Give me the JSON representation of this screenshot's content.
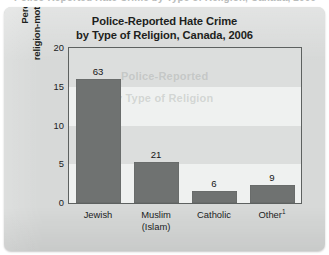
{
  "bleed_text": "Police-Reported Hate Crime by Type of Religion, Canada, 2006",
  "chart_data": {
    "type": "bar",
    "title": "Police-Reported Hate Crime by Type of Religion, Canada, 2006",
    "title_lines": [
      "Police-Reported Hate Crime",
      "by Type of Religion, Canada, 2006"
    ],
    "xlabel": "",
    "ylabel": "Percentage of religion-motivated hate crimes",
    "ylabel_lines": [
      "Percentage of",
      "religion-motivated hate crimes"
    ],
    "categories": [
      "Jewish",
      "Muslim (Islam)",
      "Catholic",
      "Other¹"
    ],
    "category_lines": [
      [
        "Jewish"
      ],
      [
        "Muslim",
        "(Islam)"
      ],
      [
        "Catholic"
      ],
      [
        "Other"
      ]
    ],
    "values": [
      16.0,
      5.3,
      1.5,
      2.3
    ],
    "point_labels": [
      "63",
      "21",
      "6",
      "9"
    ],
    "ylim": [
      0,
      20
    ],
    "yticks": [
      20,
      15,
      10,
      5,
      0
    ],
    "ytick_labels": [
      "20",
      "15",
      "10",
      "5",
      "0"
    ],
    "grid": false,
    "banded_background": true,
    "legend": null,
    "footnote_marker": "1",
    "bar_color": "#6f7271",
    "panel_color": "#d7d9d8",
    "plot_background": "#e8eae9",
    "frame_color": "#5d6160",
    "text_color": "#1d1f20"
  }
}
